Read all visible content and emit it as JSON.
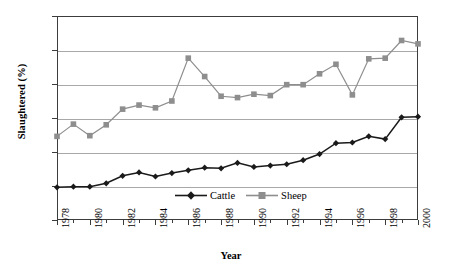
{
  "chart_data": {
    "type": "line",
    "title": "",
    "xlabel": "Year",
    "ylabel": "Slaughtered (%)",
    "xlim": [
      1978,
      2000
    ],
    "ylim": [
      0,
      30
    ],
    "yticks": [
      0,
      5,
      10,
      15,
      20,
      25,
      30
    ],
    "xticks": [
      1978,
      1980,
      1982,
      1984,
      1986,
      1988,
      1990,
      1992,
      1994,
      1996,
      1998,
      2000
    ],
    "x": [
      1978,
      1979,
      1980,
      1981,
      1982,
      1983,
      1984,
      1985,
      1986,
      1987,
      1988,
      1989,
      1990,
      1991,
      1992,
      1993,
      1994,
      1995,
      1996,
      1997,
      1998,
      1999,
      2000
    ],
    "grid": "horizontal",
    "legend_position": "inside-bottom-center",
    "series": [
      {
        "name": "Cattle",
        "color": "#1a1a1a",
        "marker": "diamond",
        "values": [
          4.8,
          4.9,
          4.9,
          5.4,
          6.5,
          7.0,
          6.4,
          6.9,
          7.3,
          7.7,
          7.6,
          8.4,
          7.8,
          8.0,
          8.2,
          8.8,
          9.7,
          11.3,
          11.4,
          12.3,
          11.9,
          15.1,
          15.2
        ]
      },
      {
        "name": "Sheep",
        "color": "#8e8e8e",
        "marker": "square",
        "values": [
          12.3,
          14.1,
          12.4,
          14.0,
          16.3,
          16.9,
          16.5,
          17.5,
          23.8,
          21.1,
          18.2,
          18.0,
          18.5,
          18.3,
          19.9,
          19.9,
          21.5,
          22.9,
          18.4,
          23.7,
          23.8,
          26.4,
          25.9
        ]
      }
    ]
  },
  "legend": {
    "items": [
      {
        "label": "Cattle"
      },
      {
        "label": "Sheep"
      }
    ]
  },
  "axis_labels": {
    "y": "Slaughtered (%)",
    "x": "Year"
  }
}
